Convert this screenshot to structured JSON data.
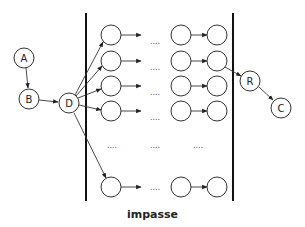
{
  "caption": "impasse",
  "nodes": {
    "A": {
      "label": "A",
      "x": 24,
      "y": 58
    },
    "B": {
      "label": "B",
      "x": 29,
      "y": 99
    },
    "D": {
      "label": "D",
      "x": 69,
      "y": 103
    },
    "R": {
      "label": "R",
      "x": 250,
      "y": 81
    },
    "C": {
      "label": "C",
      "x": 281,
      "y": 108
    }
  },
  "grid": {
    "columns_x": [
      111,
      181,
      217
    ],
    "rows_y": [
      35,
      61,
      86,
      111,
      187
    ],
    "ellipsis": "....",
    "ellipsis_row_y": 146,
    "ellipsis_cols_x": [
      112,
      155,
      198
    ]
  },
  "barriers": {
    "left_x": 86,
    "right_x": 233,
    "top_y": 13,
    "bottom_y": 201
  },
  "edges": [
    [
      "A",
      "B"
    ],
    [
      "B",
      "D"
    ],
    [
      "D",
      "row0"
    ],
    [
      "D",
      "row1"
    ],
    [
      "D",
      "row2"
    ],
    [
      "D",
      "row3"
    ],
    [
      "D",
      "row4"
    ],
    [
      "row1col2",
      "R"
    ],
    [
      "R",
      "C"
    ]
  ],
  "colors": {
    "stroke": "#333333",
    "barrier": "#111111",
    "background": "#ffffff"
  }
}
